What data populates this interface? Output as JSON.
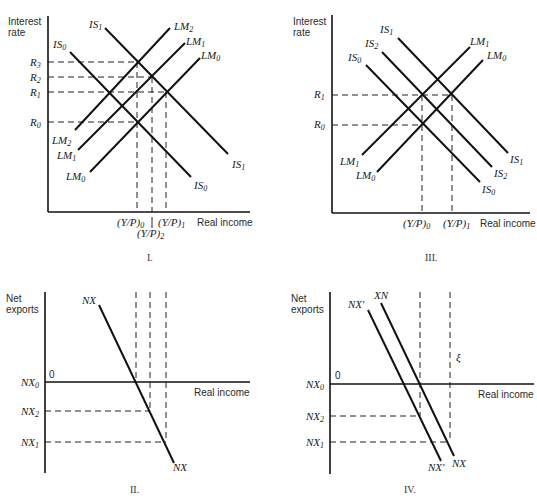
{
  "panels": {
    "I": {
      "label": "I.",
      "y_axis_label": [
        "Interest",
        "rate"
      ],
      "x_axis_label": "Real income",
      "rate_labels": [
        {
          "main": "R",
          "sub": "3"
        },
        {
          "main": "R",
          "sub": "2"
        },
        {
          "main": "R",
          "sub": "1"
        },
        {
          "main": "R",
          "sub": "0"
        }
      ],
      "income_labels": [
        {
          "main": "(Y/P)",
          "sub": "0"
        },
        {
          "main": "(Y/P)",
          "sub": "1"
        },
        {
          "main": "(Y/P)",
          "sub": "2"
        }
      ],
      "curves": [
        {
          "main": "IS",
          "sub": "1"
        },
        {
          "main": "IS",
          "sub": "0"
        },
        {
          "main": "LM",
          "sub": "2"
        },
        {
          "main": "LM",
          "sub": "1"
        },
        {
          "main": "LM",
          "sub": "0"
        }
      ]
    },
    "II": {
      "label": "II.",
      "y_axis_label": [
        "Net",
        "exports"
      ],
      "x_axis_label": "Real income",
      "origin": "0",
      "nx_labels": [
        {
          "main": "NX",
          "sub": "0"
        },
        {
          "main": "NX",
          "sub": "2"
        },
        {
          "main": "NX",
          "sub": "1"
        }
      ],
      "curve": "NX"
    },
    "III": {
      "label": "III.",
      "y_axis_label": [
        "Interest",
        "rate"
      ],
      "x_axis_label": "Real income",
      "rate_labels": [
        {
          "main": "R",
          "sub": "1"
        },
        {
          "main": "R",
          "sub": "0"
        }
      ],
      "income_labels": [
        {
          "main": "(Y/P)",
          "sub": "0"
        },
        {
          "main": "(Y/P)",
          "sub": "1"
        }
      ],
      "curves": [
        {
          "main": "IS",
          "sub": "1"
        },
        {
          "main": "IS",
          "sub": "2"
        },
        {
          "main": "IS",
          "sub": "0"
        },
        {
          "main": "LM",
          "sub": "1"
        },
        {
          "main": "LM",
          "sub": "0"
        }
      ]
    },
    "IV": {
      "label": "IV.",
      "y_axis_label": [
        "Net",
        "exports"
      ],
      "x_axis_label": "Real income",
      "origin": "0",
      "nx_labels": [
        {
          "main": "NX",
          "sub": "0"
        },
        {
          "main": "NX",
          "sub": "2"
        },
        {
          "main": "NX",
          "sub": "1"
        }
      ],
      "curve_top_labels": [
        "NX′",
        "XN"
      ],
      "curve_bottom_labels": [
        "NX′",
        "NX"
      ],
      "stray_mark": "ξ"
    }
  }
}
